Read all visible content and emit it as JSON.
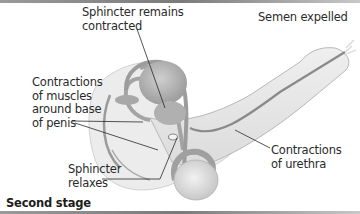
{
  "figure": {
    "caption": "Second stage",
    "labels": {
      "sphincter_contracted": "Sphincter remains\ncontracted",
      "semen_expelled": "Semen expelled",
      "muscle_contractions": "Contractions\nof muscles\naround base\nof penis",
      "sphincter_relaxes": "Sphincter\nrelaxes",
      "urethra_contractions": "Contractions\nof urethra"
    },
    "colors": {
      "body_fill": "#e6e6e6",
      "organ_fill": "#b5b5b5",
      "tube_stroke": "#8c8c8c",
      "leader_line": "#2a2a2a",
      "text": "#2a2a2a",
      "frame_bar": "#8a8a8a"
    }
  }
}
